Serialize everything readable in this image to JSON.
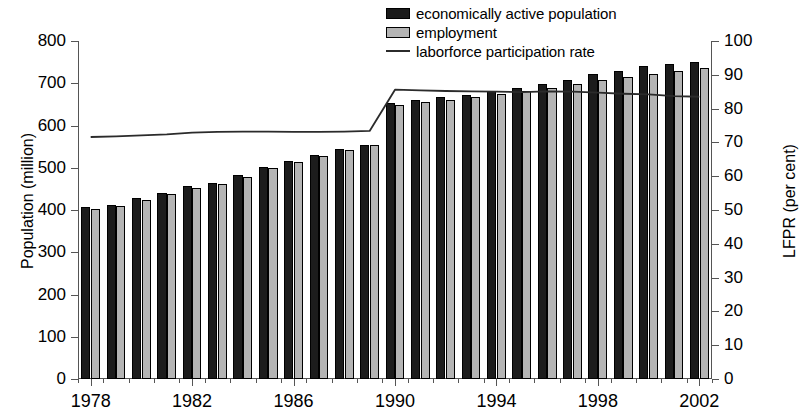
{
  "chart_data": {
    "type": "bar",
    "title": "",
    "subtitle": "",
    "xlabel": "",
    "ylabel": "Population (million)",
    "y2label": "LFPR (per cent)",
    "ylim": [
      0,
      800
    ],
    "y2lim": [
      0,
      100
    ],
    "ytick_step": 100,
    "y2tick_step": 10,
    "grid": false,
    "legend_position": "top-center",
    "yticks": [
      "0",
      "100",
      "200",
      "300",
      "400",
      "500",
      "600",
      "700",
      "800"
    ],
    "y2ticks": [
      "0",
      "10",
      "20",
      "30",
      "40",
      "50",
      "60",
      "70",
      "80",
      "90",
      "100"
    ],
    "categories": [
      1978,
      1979,
      1980,
      1981,
      1982,
      1983,
      1984,
      1985,
      1986,
      1987,
      1988,
      1989,
      1990,
      1991,
      1992,
      1993,
      1994,
      1995,
      1996,
      1997,
      1998,
      1999,
      2000,
      2001,
      2002
    ],
    "xtick_labels": [
      "1978",
      "1982",
      "1986",
      "1990",
      "1994",
      "1998",
      "2002"
    ],
    "xtick_label_years": [
      1978,
      1982,
      1986,
      1990,
      1994,
      1998,
      2002
    ],
    "series": [
      {
        "name": "economically active population",
        "axis": "left",
        "type": "bar",
        "color": "#1c1c1c",
        "values": [
          407,
          413,
          429,
          440,
          456,
          465,
          482,
          501,
          516,
          530,
          544,
          555,
          653,
          660,
          667,
          673,
          681,
          689,
          698,
          708,
          721,
          728,
          740,
          745,
          750
        ]
      },
      {
        "name": "employment",
        "axis": "left",
        "type": "bar",
        "color": "#b4b4b4",
        "values": [
          402,
          410,
          424,
          437,
          452,
          461,
          478,
          499,
          513,
          528,
          543,
          553,
          648,
          655,
          661,
          668,
          674,
          681,
          689,
          698,
          707,
          714,
          721,
          730,
          737
        ]
      },
      {
        "name": "laborforce participation rate",
        "axis": "right",
        "type": "line",
        "color": "#2b2b2b",
        "values": [
          71.6,
          71.8,
          72.1,
          72.4,
          72.9,
          73.1,
          73.2,
          73.2,
          73.1,
          73.1,
          73.2,
          73.4,
          85.6,
          85.4,
          85.2,
          85.1,
          85.0,
          84.9,
          85.1,
          85.0,
          84.7,
          84.4,
          84.2,
          83.7,
          83.5
        ]
      }
    ]
  },
  "legend": {
    "items": [
      {
        "label": "economically active population",
        "swatch": "dark-square"
      },
      {
        "label": "employment",
        "swatch": "light-square"
      },
      {
        "label": "laborforce participation rate",
        "swatch": "line"
      }
    ]
  }
}
